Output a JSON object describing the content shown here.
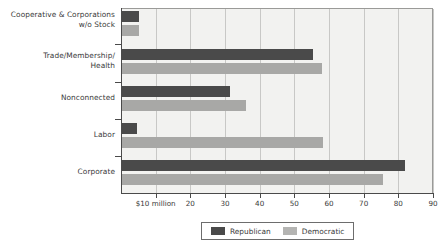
{
  "chart_data": {
    "type": "bar",
    "orientation": "horizontal",
    "title": "",
    "subtitle": "",
    "xlabel": "",
    "ylabel": "",
    "xlim": [
      0,
      90
    ],
    "grid": true,
    "legend_position": "bottom",
    "categories": [
      "Cooperative & Corporations w/o Stock",
      "Trade/Membership/ Health",
      "Nonconnected",
      "Labor",
      "Corporate"
    ],
    "category_lines": [
      [
        "Cooperative & Corporations",
        "w/o Stock"
      ],
      [
        "Trade/Membership/",
        "Health"
      ],
      [
        "Nonconnected",
        ""
      ],
      [
        "Labor",
        ""
      ],
      [
        "Corporate",
        ""
      ]
    ],
    "series": [
      {
        "name": "Republican",
        "color": "#4a4a4a",
        "values": [
          5.2,
          55.5,
          31.5,
          4.7,
          82.0
        ]
      },
      {
        "name": "Democratic",
        "color": "#a8a8a6",
        "values": [
          5.2,
          58.0,
          36.0,
          58.2,
          75.5
        ]
      }
    ],
    "xticks": [
      10,
      20,
      30,
      40,
      50,
      60,
      70,
      80,
      90
    ],
    "xtick_labels": [
      "$10 million",
      "20",
      "30",
      "40",
      "50",
      "60",
      "70",
      "80",
      "90"
    ]
  },
  "legend": {
    "items": [
      {
        "label": "Republican",
        "swatch": "rep"
      },
      {
        "label": "Democratic",
        "swatch": "dem"
      }
    ]
  }
}
